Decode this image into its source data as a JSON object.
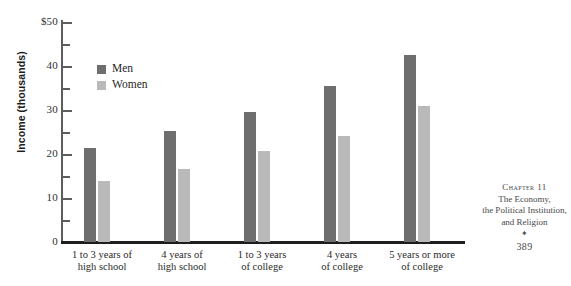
{
  "chart_data": {
    "type": "bar",
    "title": "",
    "xlabel": "",
    "ylabel": "Income (thousands)",
    "ylim": [
      0,
      50
    ],
    "ytick_values": [
      0,
      10,
      20,
      30,
      40,
      50
    ],
    "ytick_labels": [
      "0",
      "10",
      "20",
      "30",
      "40",
      "$50"
    ],
    "yminor_tick_values": [
      5,
      15,
      25,
      35,
      45
    ],
    "grid": false,
    "legend_position": "upper-left-inside",
    "categories": [
      "1 to 3 years of\nhigh school",
      "4 years of\nhigh school",
      "1 to 3 years\nof college",
      "4 years\nof college",
      "5 years or more\nof college"
    ],
    "series": [
      {
        "name": "Men",
        "color": "#6e6e6e",
        "values": [
          21.3,
          25.3,
          29.5,
          35.5,
          42.6
        ]
      },
      {
        "name": "Women",
        "color": "#b9b9b9",
        "values": [
          13.9,
          16.6,
          20.7,
          24.1,
          30.9
        ]
      }
    ]
  },
  "legend": {
    "items": [
      {
        "label": "Men"
      },
      {
        "label": "Women"
      }
    ]
  },
  "footer": {
    "chapter": "Chapter 11",
    "line1": "The Economy,",
    "line2": "the Political Institution,",
    "line3": "and Religion",
    "ornament": "✦",
    "page": "389"
  }
}
